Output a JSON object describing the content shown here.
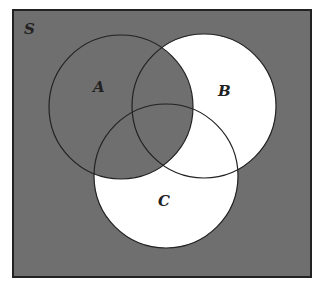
{
  "diagram": {
    "type": "venn",
    "universe_label": "S",
    "sets": [
      {
        "label": "A",
        "shaded": true
      },
      {
        "label": "B",
        "shaded": false
      },
      {
        "label": "C",
        "shaded": false
      }
    ],
    "shaded_region_description": "Everything shaded except (B ∪ C) minus A; i.e., A ∪ (B ∪ C)' plus intersections with A",
    "colors": {
      "shade": "#6f6f6f",
      "unshaded": "#ffffff",
      "stroke": "#222222"
    }
  }
}
